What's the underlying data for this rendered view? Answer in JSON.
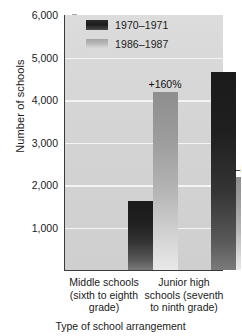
{
  "chart_data": {
    "type": "bar",
    "title": "",
    "xlabel": "Type of school arrangement",
    "ylabel": "Number of schools",
    "ylim": [
      0,
      6000
    ],
    "yticks": [
      "1,000",
      "2,000",
      "3,000",
      "4,000",
      "5,000",
      "6,000"
    ],
    "ytick_values": [
      1000,
      2000,
      3000,
      4000,
      5000,
      6000
    ],
    "grid": true,
    "legend_position": "top-center",
    "categories": [
      "Middle schools (sixth to eighth grade)",
      "Junior high schools (seventh to ninth grade)"
    ],
    "category_lines": [
      [
        "Middle schools",
        "(sixth to eighth",
        "grade)"
      ],
      [
        "Junior high",
        "schools (seventh",
        "to ninth grade)"
      ]
    ],
    "series": [
      {
        "name": "1970–1971",
        "values": [
          1620,
          4650
        ],
        "color": "#1f1f1f"
      },
      {
        "name": "1986–1987",
        "values": [
          4200,
          2180
        ],
        "color": "#b4b4b4"
      }
    ],
    "annotations": [
      {
        "text": "+160%",
        "category": "Middle schools (sixth to eighth grade)",
        "series": "1986–1987"
      },
      {
        "text": "–53%",
        "category": "Junior high schools (seventh to ninth grade)",
        "series": "1986–1987"
      }
    ]
  },
  "colors": {
    "plot_background": "#d4d4d4",
    "gridline": "#f4f4f4",
    "axis": "#3a3a3a",
    "page_background": "#ffffff",
    "text": "#1a1a1a"
  }
}
